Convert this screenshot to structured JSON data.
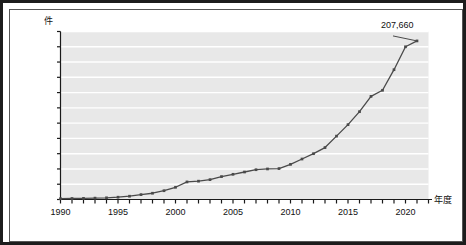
{
  "chart_data": {
    "type": "line",
    "title": "",
    "xlabel": "年度",
    "ylabel": "件",
    "ylim": [
      0,
      220000
    ],
    "xlim": [
      1990,
      2021
    ],
    "grid": true,
    "legend": "none",
    "y_ticks": [
      "220,000",
      "200,000",
      "180,000",
      "160,000",
      "140,000",
      "120,000",
      "100,000",
      "80,000",
      "60,000",
      "40,000",
      "20,000",
      "0"
    ],
    "y_tick_values": [
      220000,
      200000,
      180000,
      160000,
      140000,
      120000,
      100000,
      80000,
      60000,
      40000,
      20000,
      0
    ],
    "x_ticks": [
      "1990",
      "1995",
      "2000",
      "2005",
      "2010",
      "2015",
      "2020"
    ],
    "x_tick_values": [
      1990,
      1995,
      2000,
      2005,
      2010,
      2015,
      2020
    ],
    "x": [
      1990,
      1991,
      1992,
      1993,
      1994,
      1995,
      1996,
      1997,
      1998,
      1999,
      2000,
      2001,
      2002,
      2003,
      2004,
      2005,
      2006,
      2007,
      2008,
      2009,
      2010,
      2011,
      2012,
      2013,
      2014,
      2015,
      2016,
      2017,
      2018,
      2019,
      2020,
      2021
    ],
    "values": [
      1100,
      1300,
      1500,
      1800,
      2200,
      3000,
      4300,
      6400,
      8200,
      11500,
      16000,
      23000,
      24000,
      26000,
      30000,
      33000,
      36000,
      39000,
      40000,
      40500,
      46000,
      53000,
      60000,
      68000,
      83000,
      98000,
      115000,
      135000,
      143000,
      170000,
      200000,
      207660
    ],
    "annotations": [
      {
        "label": "207,660",
        "x": 2021,
        "y": 207660
      }
    ],
    "marker": "square",
    "line_color": "#4a4a4a",
    "plot_background": "#e8e8e8",
    "gridline_color": "#ffffff"
  },
  "colors": {
    "frame": "#1c1c1c",
    "inner_frame": "#555555",
    "axis": "#1a1a1a",
    "text": "#111111"
  }
}
